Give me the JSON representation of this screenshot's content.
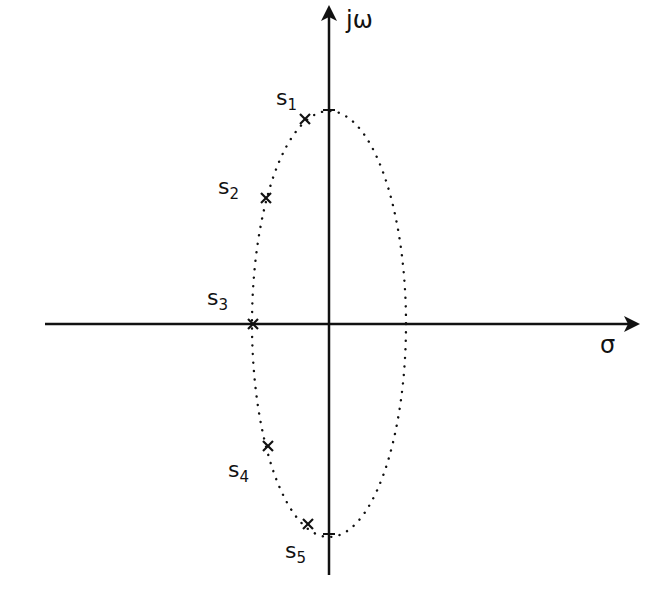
{
  "diagram": {
    "type": "s-plane pole plot",
    "axes": {
      "vertical_label": "jω",
      "horizontal_label": "σ",
      "origin": [
        329,
        324
      ]
    },
    "ellipse": {
      "style": "dotted",
      "center": [
        329,
        324
      ],
      "rx": 77,
      "ry": 213
    },
    "poles": [
      {
        "id": "s1",
        "label": "s",
        "sub": "1",
        "x": 305,
        "y": 119,
        "label_x": 276,
        "label_y": 87
      },
      {
        "id": "s2",
        "label": "s",
        "sub": "2",
        "x": 266,
        "y": 198,
        "label_x": 218,
        "label_y": 176
      },
      {
        "id": "s3",
        "label": "s",
        "sub": "3",
        "x": 253,
        "y": 324,
        "label_x": 207,
        "label_y": 287
      },
      {
        "id": "s4",
        "label": "s",
        "sub": "4",
        "x": 268,
        "y": 446,
        "label_x": 228,
        "label_y": 459
      },
      {
        "id": "s5",
        "label": "s",
        "sub": "5",
        "x": 308,
        "y": 524,
        "label_x": 285,
        "label_y": 540
      }
    ],
    "colors": {
      "ink": "#111111",
      "background": "#ffffff"
    }
  }
}
